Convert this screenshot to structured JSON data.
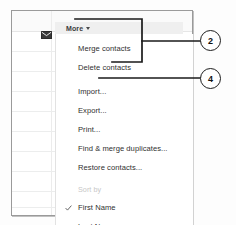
{
  "app": {
    "frame_name": "google-contacts-window",
    "border_color": "#9a9a9a"
  },
  "toolbar": {
    "mail_icon": "envelope-icon",
    "more_button": {
      "label": "More",
      "caret_icon": "chevron-down-icon"
    }
  },
  "menu": {
    "items": [
      {
        "label": "Merge contacts",
        "type": "item",
        "checked": false,
        "disabled": false
      },
      {
        "label": "Delete contacts",
        "type": "item",
        "checked": false,
        "disabled": false
      },
      {
        "label": "Import...",
        "type": "item",
        "checked": false,
        "disabled": false
      },
      {
        "label": "Export...",
        "type": "item",
        "checked": false,
        "disabled": false
      },
      {
        "label": "Print...",
        "type": "item",
        "checked": false,
        "disabled": false
      },
      {
        "label": "Find & merge duplicates...",
        "type": "item",
        "checked": false,
        "disabled": false
      },
      {
        "label": "Restore contacts...",
        "type": "item",
        "checked": false,
        "disabled": false
      },
      {
        "label": "Sort by",
        "type": "group-label",
        "checked": false,
        "disabled": true
      },
      {
        "label": "First Name",
        "type": "item",
        "checked": true,
        "disabled": false
      },
      {
        "label": "Last Name",
        "type": "item",
        "checked": false,
        "disabled": false
      }
    ],
    "check_icon": "checkmark-icon"
  },
  "annotations": {
    "callouts": [
      {
        "number": "2",
        "target": "more-button-and-contact-actions"
      },
      {
        "number": "4",
        "target": "import-menu-item"
      }
    ],
    "line_color": "#1a1a1a"
  }
}
